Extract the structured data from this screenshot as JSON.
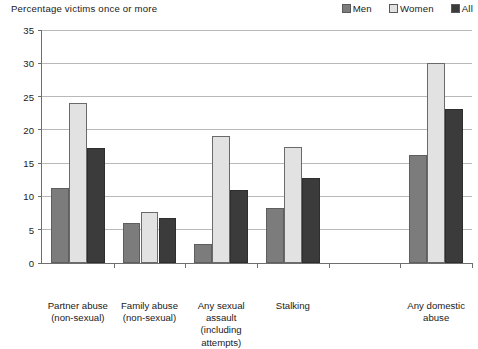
{
  "chart_data": {
    "type": "bar",
    "title": "Percentage victims once or more",
    "xlabel": "",
    "ylabel": "",
    "ylim": [
      0,
      35
    ],
    "yticks": [
      0,
      5,
      10,
      15,
      20,
      25,
      30,
      35
    ],
    "grid": true,
    "legend_position": "top-right",
    "categories": [
      "Partner abuse\n(non-sexual)",
      "Family abuse\n(non-sexual)",
      "Any sexual\nassault\n(including\nattempts)",
      "Stalking",
      "",
      "Any domestic\nabuse"
    ],
    "category_lines": [
      [
        "Partner abuse",
        "(non-sexual)"
      ],
      [
        "Family abuse",
        "(non-sexual)"
      ],
      [
        "Any sexual",
        "assault",
        "(including",
        "attempts)"
      ],
      [
        "Stalking"
      ],
      [],
      [
        "Any domestic",
        "abuse"
      ]
    ],
    "series": [
      {
        "name": "Men",
        "color": "#7c7c7c",
        "values": [
          11.2,
          6.0,
          2.8,
          8.3,
          null,
          16.2
        ]
      },
      {
        "name": "Women",
        "color": "#e2e2e2",
        "values": [
          24.0,
          7.6,
          19.1,
          17.4,
          null,
          30.0
        ]
      },
      {
        "name": "All",
        "color": "#3b3b3b",
        "values": [
          17.3,
          6.8,
          11.0,
          12.8,
          null,
          23.2
        ]
      }
    ]
  },
  "legend": {
    "items": [
      {
        "label": "Men",
        "color": "#7c7c7c"
      },
      {
        "label": "Women",
        "color": "#e2e2e2"
      },
      {
        "label": "All",
        "color": "#3b3b3b"
      }
    ]
  }
}
